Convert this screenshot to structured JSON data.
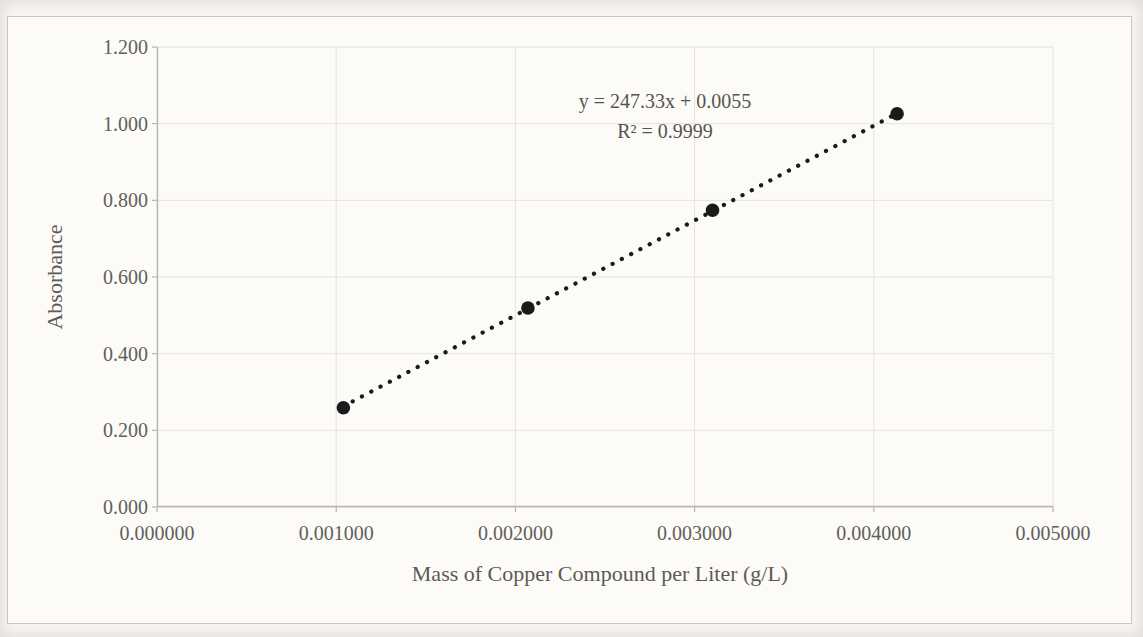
{
  "chart_data": {
    "type": "scatter",
    "title": "",
    "xlabel": "Mass of Copper Compound per Liter (g/L)",
    "ylabel": "Absorbance",
    "xlim": [
      0,
      0.005
    ],
    "ylim": [
      0,
      1.2
    ],
    "grid": true,
    "legend": "none",
    "x_tick_values": [
      0,
      0.001,
      0.002,
      0.003,
      0.004,
      0.005
    ],
    "x_tick_labels": [
      "0.000000",
      "0.001000",
      "0.002000",
      "0.003000",
      "0.004000",
      "0.005000"
    ],
    "y_tick_values": [
      0,
      0.2,
      0.4,
      0.6,
      0.8,
      1.0,
      1.2
    ],
    "y_tick_labels": [
      "0.000",
      "0.200",
      "0.400",
      "0.600",
      "0.800",
      "1.000",
      "1.200"
    ],
    "points": {
      "x": [
        0.00104,
        0.00207,
        0.0031,
        0.00413
      ],
      "y": [
        0.259,
        0.519,
        0.774,
        1.026
      ]
    },
    "trendline": {
      "type": "linear",
      "style": "dotted",
      "slope": 247.33,
      "intercept": 0.0055,
      "x_start": 0.00104,
      "x_end": 0.00413,
      "equation": "y = 247.33x + 0.0055",
      "r_squared_label": "R² = 0.9999",
      "r_squared": 0.9999
    },
    "colors": {
      "marker": "#1a1a1a",
      "trendline": "#1a1a1a",
      "grid": "#e6e3dd",
      "axis": "#b7b4ad",
      "text": "#5e5c58",
      "frame_border": "#c9c6c0",
      "chart_background": "#fcfbf8"
    }
  }
}
